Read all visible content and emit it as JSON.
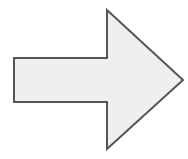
{
  "diagram": {
    "shape": "right-arrow",
    "direction": "right",
    "colors": {
      "fill": "#efefef",
      "stroke": "#555555",
      "background": "#ffffff"
    },
    "geometry": {
      "points": "14,58 107,58 107,10 183,80 107,149 107,102 14,102",
      "stroke_width": "2"
    }
  }
}
